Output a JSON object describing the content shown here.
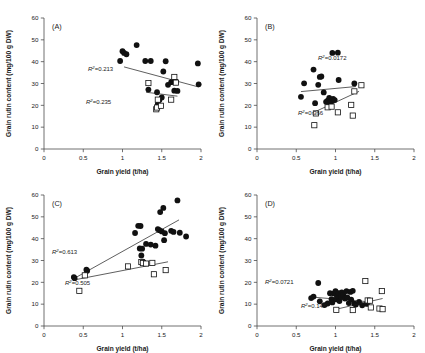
{
  "figure": {
    "axis_titles": {
      "x": "Grain yield (t/ha)",
      "y": "Grain rutin content (mg/100 g DW)"
    },
    "x_ticks": [
      "0",
      "0.5",
      "1",
      "1.5",
      "2"
    ],
    "y_ticks": [
      "0",
      "10",
      "20",
      "30",
      "40",
      "50",
      "60"
    ],
    "series_names": [
      "filled-circles",
      "open-squares"
    ]
  },
  "chart_data": [
    {
      "type": "scatter",
      "panel": "(A)",
      "title": "",
      "xlabel": "Grain yield (t/ha)",
      "ylabel": "Grain rutin content (mg/100 g DW)",
      "xlim": [
        0,
        2
      ],
      "ylim": [
        0,
        60
      ],
      "xticks": [
        0,
        0.5,
        1,
        1.5,
        2
      ],
      "yticks": [
        0,
        10,
        20,
        30,
        40,
        50,
        60
      ],
      "grid": false,
      "legend": "none",
      "series": [
        {
          "name": "filled-circles",
          "marker": "filled-circle",
          "r2": "0.213",
          "r2_label": "R²=0.213",
          "trend": {
            "x0": 1.02,
            "y0": 37.6,
            "x1": 1.97,
            "y1": 28.4
          },
          "points": [
            [
              0.97,
              40.3
            ],
            [
              1.0,
              44.8
            ],
            [
              1.02,
              44.0
            ],
            [
              1.05,
              43.4
            ],
            [
              1.18,
              47.6
            ],
            [
              1.29,
              40.3
            ],
            [
              1.36,
              40.3
            ],
            [
              1.33,
              27.2
            ],
            [
              1.44,
              26.0
            ],
            [
              1.45,
              20.6
            ],
            [
              1.47,
              22.5
            ],
            [
              1.5,
              23.6
            ],
            [
              1.52,
              35.5
            ],
            [
              1.55,
              40.2
            ],
            [
              1.58,
              29.4
            ],
            [
              1.62,
              30.6
            ],
            [
              1.64,
              31.0
            ],
            [
              1.66,
              26.7
            ],
            [
              1.68,
              30.8
            ],
            [
              1.7,
              26.6
            ],
            [
              1.96,
              39.2
            ],
            [
              1.97,
              29.6
            ]
          ]
        },
        {
          "name": "open-squares",
          "marker": "open-square",
          "r2": "0.235",
          "r2_label": "R²=0.235",
          "trend": {
            "x0": 1.3,
            "y0": 26.0,
            "x1": 1.7,
            "y1": 24.2
          },
          "points": [
            [
              1.33,
              30.2
            ],
            [
              1.43,
              18.2
            ],
            [
              1.44,
              19.0
            ],
            [
              1.49,
              19.8
            ],
            [
              1.45,
              22.6
            ],
            [
              1.62,
              22.6
            ],
            [
              1.66,
              33.0
            ],
            [
              1.68,
              30.4
            ]
          ]
        }
      ]
    },
    {
      "type": "scatter",
      "panel": "(B)",
      "title": "",
      "xlabel": "Grain yield (t/ha)",
      "ylabel": "Grain rutin content (mg/100 g DW)",
      "xlim": [
        0,
        2
      ],
      "ylim": [
        0,
        60
      ],
      "xticks": [
        0,
        0.5,
        1,
        1.5,
        2
      ],
      "yticks": [
        0,
        10,
        20,
        30,
        40,
        50,
        60
      ],
      "grid": false,
      "legend": "none",
      "series": [
        {
          "name": "filled-circles",
          "marker": "filled-circle",
          "r2": "0.0172",
          "r2_label": "R²=0.0172",
          "trend": {
            "x0": 0.56,
            "y0": 26.3,
            "x1": 1.26,
            "y1": 28.6
          },
          "points": [
            [
              0.56,
              23.9
            ],
            [
              0.6,
              30.1
            ],
            [
              0.72,
              36.4
            ],
            [
              0.74,
              21.0
            ],
            [
              0.78,
              29.4
            ],
            [
              0.8,
              33.0
            ],
            [
              0.82,
              33.2
            ],
            [
              0.85,
              25.9
            ],
            [
              0.88,
              21.6
            ],
            [
              0.9,
              22.2
            ],
            [
              0.91,
              21.1
            ],
            [
              0.92,
              23.4
            ],
            [
              0.93,
              20.8
            ],
            [
              0.94,
              22.6
            ],
            [
              0.95,
              21.9
            ],
            [
              0.96,
              44.0
            ],
            [
              0.97,
              23.0
            ],
            [
              0.99,
              22.4
            ],
            [
              1.03,
              44.1
            ],
            [
              1.04,
              31.6
            ],
            [
              1.24,
              30.0
            ]
          ]
        },
        {
          "name": "open-squares",
          "marker": "open-square",
          "r2": "0.366",
          "r2_label": "R²=0.366",
          "trend": {
            "x0": 0.7,
            "y0": 16.4,
            "x1": 1.3,
            "y1": 26.4
          },
          "points": [
            [
              0.73,
              10.9
            ],
            [
              0.75,
              16.3
            ],
            [
              0.9,
              19.1
            ],
            [
              0.95,
              19.4
            ],
            [
              1.03,
              16.8
            ],
            [
              1.2,
              20.2
            ],
            [
              1.22,
              15.3
            ],
            [
              1.24,
              26.4
            ],
            [
              1.33,
              29.2
            ]
          ]
        }
      ]
    },
    {
      "type": "scatter",
      "panel": "(C)",
      "title": "",
      "xlabel": "Grain yield (t/ha)",
      "ylabel": "Grain rutin content (mg/100 g DW)",
      "xlim": [
        0,
        2
      ],
      "ylim": [
        0,
        60
      ],
      "xticks": [
        0,
        0.5,
        1,
        1.5,
        2
      ],
      "yticks": [
        0,
        10,
        20,
        30,
        40,
        50,
        60
      ],
      "grid": false,
      "legend": "none",
      "series": [
        {
          "name": "filled-circles",
          "marker": "filled-circle",
          "r2": "0.613",
          "r2_label": "R²=0.613",
          "trend": {
            "x0": 0.37,
            "y0": 21.5,
            "x1": 1.72,
            "y1": 48.6
          },
          "points": [
            [
              0.38,
              22.4
            ],
            [
              0.39,
              21.9
            ],
            [
              0.54,
              25.8
            ],
            [
              0.55,
              25.3
            ],
            [
              1.16,
              42.6
            ],
            [
              1.2,
              45.9
            ],
            [
              1.23,
              45.8
            ],
            [
              1.22,
              35.5
            ],
            [
              1.25,
              35.4
            ],
            [
              1.24,
              32.3
            ],
            [
              1.26,
              29.5
            ],
            [
              1.3,
              37.6
            ],
            [
              1.36,
              37.3
            ],
            [
              1.42,
              36.8
            ],
            [
              1.45,
              44.4
            ],
            [
              1.47,
              43.9
            ],
            [
              1.48,
              52.2
            ],
            [
              1.5,
              43.3
            ],
            [
              1.52,
              54.1
            ],
            [
              1.53,
              39.3
            ],
            [
              1.54,
              42.5
            ],
            [
              1.62,
              43.6
            ],
            [
              1.65,
              43.1
            ],
            [
              1.7,
              57.5
            ],
            [
              1.73,
              42.7
            ],
            [
              1.81,
              41.0
            ]
          ]
        },
        {
          "name": "open-squares",
          "marker": "open-square",
          "r2": "0.505",
          "r2_label": "R²=0.505",
          "trend": {
            "x0": 0.37,
            "y0": 21.0,
            "x1": 1.58,
            "y1": 29.4
          },
          "points": [
            [
              0.45,
              16.1
            ],
            [
              0.52,
              23.2
            ],
            [
              1.07,
              27.3
            ],
            [
              1.24,
              29.3
            ],
            [
              1.26,
              28.8
            ],
            [
              1.3,
              28.6
            ],
            [
              1.38,
              28.9
            ],
            [
              1.4,
              23.7
            ],
            [
              1.55,
              25.6
            ]
          ]
        }
      ]
    },
    {
      "type": "scatter",
      "panel": "(D)",
      "title": "",
      "xlabel": "Grain yield (t/ha)",
      "ylabel": "Grain rutin content (mg/100 g DW)",
      "xlim": [
        0,
        2
      ],
      "ylim": [
        0,
        60
      ],
      "xticks": [
        0,
        0.5,
        1,
        1.5,
        2
      ],
      "yticks": [
        0,
        10,
        20,
        30,
        40,
        50,
        60
      ],
      "grid": false,
      "legend": "none",
      "series": [
        {
          "name": "filled-circles",
          "marker": "filled-circle",
          "r2": "0.0721",
          "r2_label": "R²=0.0721",
          "trend": {
            "x0": 0.68,
            "y0": 13.3,
            "x1": 1.42,
            "y1": 11.1
          },
          "points": [
            [
              0.69,
              12.8
            ],
            [
              0.72,
              13.5
            ],
            [
              0.78,
              19.7
            ],
            [
              0.8,
              11.3
            ],
            [
              0.86,
              9.6
            ],
            [
              0.9,
              10.3
            ],
            [
              0.93,
              15.0
            ],
            [
              0.95,
              12.3
            ],
            [
              0.96,
              10.8
            ],
            [
              0.98,
              14.9
            ],
            [
              1.0,
              16.0
            ],
            [
              1.01,
              12.2
            ],
            [
              1.02,
              13.6
            ],
            [
              1.04,
              15.1
            ],
            [
              1.05,
              11.4
            ],
            [
              1.07,
              13.3
            ],
            [
              1.08,
              15.4
            ],
            [
              1.1,
              14.2
            ],
            [
              1.12,
              12.6
            ],
            [
              1.14,
              16.0
            ],
            [
              1.15,
              13.1
            ],
            [
              1.17,
              10.5
            ],
            [
              1.19,
              15.6
            ],
            [
              1.2,
              12.1
            ],
            [
              1.22,
              16.1
            ],
            [
              1.24,
              10.2
            ],
            [
              1.26,
              9.8
            ],
            [
              1.3,
              11.0
            ],
            [
              1.34,
              9.5
            ],
            [
              1.4,
              10.1
            ]
          ]
        },
        {
          "name": "open-squares",
          "marker": "open-square",
          "r2": "0.147",
          "r2_label": "R²=0.147",
          "trend": {
            "x0": 1.0,
            "y0": 7.6,
            "x1": 1.6,
            "y1": 12.6
          },
          "points": [
            [
              1.01,
              7.4
            ],
            [
              1.22,
              7.3
            ],
            [
              1.38,
              20.6
            ],
            [
              1.41,
              11.7
            ],
            [
              1.44,
              11.6
            ],
            [
              1.45,
              8.5
            ],
            [
              1.56,
              8.0
            ],
            [
              1.59,
              16.0
            ],
            [
              1.6,
              7.7
            ]
          ]
        }
      ]
    }
  ]
}
